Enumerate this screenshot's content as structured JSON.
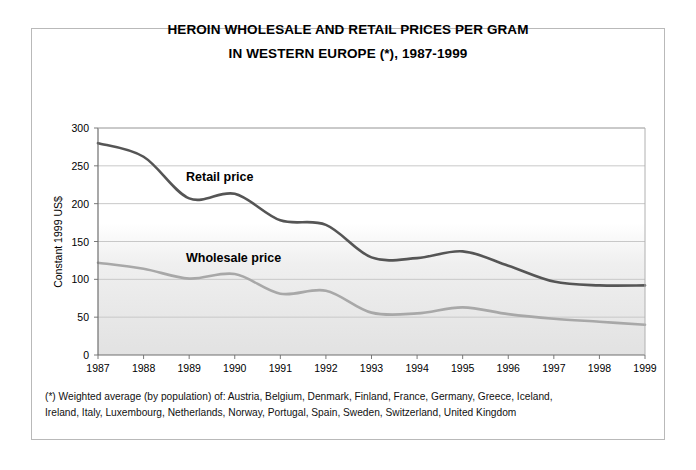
{
  "title": {
    "line1": "HEROIN WHOLESALE AND RETAIL PRICES PER GRAM",
    "line2": "IN WESTERN EUROPE (*), 1987-1999"
  },
  "footnote": {
    "line1": "(*) Weighted average (by population) of: Austria, Belgium, Denmark, Finland, France, Germany, Greece, Iceland,",
    "line2": "Ireland, Italy, Luxembourg, Netherlands, Norway, Portugal, Spain, Sweden, Switzerland, United Kingdom"
  },
  "annotations": {
    "retail_label": "Retail price",
    "wholesale_label": "Wholesale price"
  },
  "colors": {
    "retail": "#555555",
    "wholesale": "#a8a8a8",
    "axis": "#7a7a7a",
    "grid": "#c8c8c8",
    "frame": "#b9b9b9",
    "text": "#000000"
  },
  "chart_data": {
    "type": "line",
    "title": "HEROIN WHOLESALE AND RETAIL PRICES PER GRAM IN WESTERN EUROPE (*), 1987-1999",
    "xlabel": "",
    "ylabel": "Constant 1999 US$",
    "x": [
      1987,
      1988,
      1989,
      1990,
      1991,
      1992,
      1993,
      1994,
      1995,
      1996,
      1997,
      1998,
      1999
    ],
    "xticklabels": [
      "1987",
      "1988",
      "1989",
      "1990",
      "1991",
      "1992",
      "1993",
      "1994",
      "1995",
      "1996",
      "1997",
      "1998",
      "1999"
    ],
    "ylim": [
      0,
      300
    ],
    "yticks": [
      0,
      50,
      100,
      150,
      200,
      250,
      300
    ],
    "yticklabels": [
      "0",
      "50",
      "100",
      "150",
      "200",
      "250",
      "300"
    ],
    "grid": true,
    "legend": "inline-annotations",
    "series": [
      {
        "name": "Retail price",
        "color": "#555555",
        "values": [
          280,
          262,
          207,
          213,
          178,
          172,
          129,
          128,
          137,
          118,
          97,
          92,
          92
        ]
      },
      {
        "name": "Wholesale price",
        "color": "#a8a8a8",
        "values": [
          122,
          114,
          101,
          107,
          81,
          85,
          56,
          55,
          63,
          54,
          48,
          44,
          40
        ]
      }
    ]
  }
}
